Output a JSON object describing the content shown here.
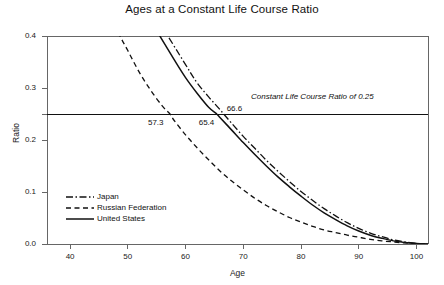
{
  "chart_data": {
    "type": "line",
    "title": "Ages at a Constant Life Course Ratio",
    "xlabel": "Age",
    "ylabel": "Ratio",
    "xlim": [
      36,
      102
    ],
    "ylim": [
      0.0,
      0.4
    ],
    "xticks": [
      40,
      50,
      60,
      70,
      80,
      90,
      100
    ],
    "xtick_labels": [
      "40",
      "50",
      "60",
      "70",
      "80",
      "90",
      "100"
    ],
    "yticks": [
      0.0,
      0.1,
      0.2,
      0.3,
      0.4
    ],
    "ytick_labels": [
      "0.0",
      "0.1",
      "0.2",
      "0.3",
      "0.4"
    ],
    "grid": false,
    "legend_position": "lower left",
    "reference_line": {
      "value": 0.25,
      "orientation": "horizontal",
      "label": "Constant Life Course Ratio of 0.25",
      "style": "solid"
    },
    "annotations": [
      {
        "text": "57.3",
        "x": 57.3,
        "y": 0.25,
        "series": "Russian Federation"
      },
      {
        "text": "65.4",
        "x": 65.4,
        "y": 0.25,
        "series": "United States"
      },
      {
        "text": "66.6",
        "x": 66.6,
        "y": 0.25,
        "series": "Japan"
      }
    ],
    "series": [
      {
        "name": "Japan",
        "style": "dashdot",
        "x": [
          36,
          40,
          45,
          50,
          55,
          60,
          62,
          64,
          66,
          66.6,
          68,
          70,
          72,
          74,
          76,
          78,
          80,
          82,
          84,
          86,
          88,
          90,
          92,
          94,
          96,
          98,
          100,
          102
        ],
        "y": [
          0.83,
          0.74,
          0.625,
          0.525,
          0.435,
          0.345,
          0.31,
          0.283,
          0.258,
          0.25,
          0.232,
          0.207,
          0.184,
          0.161,
          0.14,
          0.12,
          0.101,
          0.084,
          0.068,
          0.054,
          0.041,
          0.03,
          0.021,
          0.014,
          0.008,
          0.004,
          0.001,
          0.0
        ]
      },
      {
        "name": "Russian Federation",
        "style": "dashed",
        "x": [
          36,
          40,
          44,
          48,
          50,
          52,
          54,
          56,
          57.3,
          58,
          60,
          62,
          64,
          66,
          68,
          70,
          72,
          74,
          76,
          78,
          80,
          82,
          84,
          86,
          88,
          90,
          92,
          94,
          96,
          98,
          100,
          102
        ],
        "y": [
          0.74,
          0.625,
          0.52,
          0.415,
          0.372,
          0.33,
          0.295,
          0.265,
          0.25,
          0.238,
          0.21,
          0.185,
          0.162,
          0.14,
          0.121,
          0.104,
          0.088,
          0.074,
          0.062,
          0.051,
          0.042,
          0.034,
          0.027,
          0.022,
          0.017,
          0.013,
          0.009,
          0.006,
          0.004,
          0.002,
          0.001,
          0.0
        ]
      },
      {
        "name": "United States",
        "style": "solid",
        "x": [
          36,
          40,
          45,
          50,
          55,
          58,
          60,
          62,
          64,
          65.4,
          66,
          68,
          70,
          72,
          74,
          76,
          78,
          80,
          82,
          84,
          86,
          88,
          90,
          92,
          94,
          96,
          98,
          100,
          102
        ],
        "y": [
          0.8,
          0.71,
          0.6,
          0.5,
          0.41,
          0.355,
          0.32,
          0.29,
          0.263,
          0.25,
          0.243,
          0.219,
          0.195,
          0.172,
          0.15,
          0.129,
          0.11,
          0.092,
          0.075,
          0.06,
          0.047,
          0.035,
          0.025,
          0.017,
          0.011,
          0.006,
          0.003,
          0.001,
          0.0
        ]
      }
    ]
  },
  "legend": {
    "items": [
      {
        "label": "Japan",
        "style": "dashdot"
      },
      {
        "label": "Russian Federation",
        "style": "dashed"
      },
      {
        "label": "United States",
        "style": "solid"
      }
    ]
  },
  "colors": {
    "line": "#111111",
    "axis": "#666666",
    "text": "#1a1a1a",
    "background": "#ffffff"
  }
}
